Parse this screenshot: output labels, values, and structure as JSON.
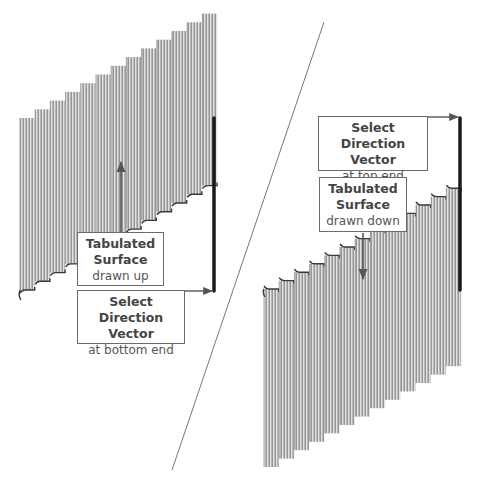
{
  "colors": {
    "background": "#ffffff",
    "surface_fill": "#b9b9b9",
    "surface_stripe_light": "#e2e2e2",
    "surface_stripe_dark": "#8d8d8d",
    "surface_edge": "#3a3a3a",
    "vector_line": "#1a1a1a",
    "arrow": "#555555",
    "divider": "#777777",
    "box_border": "#6b6b6b"
  },
  "left_panel": {
    "surface_label": {
      "title_line1": "Tabulated",
      "title_line2": "Surface",
      "subtitle": "drawn up"
    },
    "vector_label": {
      "title_line1": "Select",
      "title_line2": "Direction Vector",
      "subtitle": "at bottom end"
    }
  },
  "right_panel": {
    "vector_label": {
      "title_line1": "Select",
      "title_line2": "Direction Vector",
      "subtitle": "at top end"
    },
    "surface_label": {
      "title_line1": "Tabulated",
      "title_line2": "Surface",
      "subtitle": "drawn down"
    }
  },
  "geometry": {
    "left_surface": {
      "x0": 20,
      "panel_w": 15.2,
      "panels": 13,
      "top_y0": 118,
      "top_step": -8.7,
      "height": 172
    },
    "right_surface": {
      "x0": 264,
      "panel_w": 15.2,
      "panels": 13,
      "top_y0": 289,
      "top_step": -8.4,
      "height": 178
    },
    "divider": {
      "x1": 324,
      "y1": 22,
      "x2": 172,
      "y2": 470
    },
    "left_vector": {
      "x": 214,
      "y1": 118,
      "y2": 291
    },
    "right_vector": {
      "x": 460,
      "y1": 118,
      "y2": 290
    }
  }
}
